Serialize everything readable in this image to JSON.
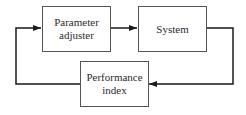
{
  "diagram": {
    "type": "feedback-block-diagram",
    "blocks": [
      {
        "id": "parameter-adjuster",
        "lines": [
          "Parameter",
          "adjuster"
        ]
      },
      {
        "id": "system",
        "lines": [
          "System"
        ]
      },
      {
        "id": "performance-index",
        "lines": [
          "Performance",
          "index"
        ]
      }
    ],
    "connections": [
      {
        "from": "parameter-adjuster",
        "to": "system",
        "arrow": true
      },
      {
        "from": "system",
        "to": "performance-index",
        "arrow": true,
        "route": "right-down-left"
      },
      {
        "from": "performance-index",
        "to": "parameter-adjuster",
        "arrow": true,
        "route": "left-up-right"
      }
    ],
    "colors": {
      "line": "#1a1a1a",
      "border": "#555555",
      "text": "#2a2a2a",
      "background": "#ffffff"
    }
  }
}
